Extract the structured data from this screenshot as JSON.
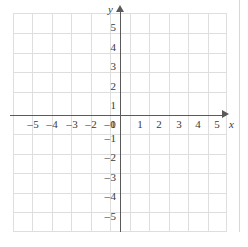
{
  "figure": {
    "kind": "cartesian-coordinate-plane",
    "axis_color": "#5a5a5a",
    "grid_color": "#dedede",
    "label_color": "#3a3a3a",
    "background": "#ffffff"
  },
  "axes": {
    "x": {
      "name": "x",
      "min": -5,
      "max": 5,
      "step": 1,
      "arrow": "right",
      "tick_labels": [
        "-5",
        "-4",
        "-3",
        "-2",
        "-1",
        "1",
        "2",
        "3",
        "4",
        "5"
      ],
      "tick_values": [
        -5,
        -4,
        -3,
        -2,
        -1,
        1,
        2,
        3,
        4,
        5
      ]
    },
    "y": {
      "name": "y",
      "min": -5,
      "max": 5,
      "step": 1,
      "arrow": "up",
      "tick_labels": [
        "5",
        "4",
        "3",
        "2",
        "1",
        "-1",
        "-2",
        "-3",
        "-4",
        "-5"
      ],
      "tick_values": [
        5,
        4,
        3,
        2,
        1,
        -1,
        -2,
        -3,
        -4,
        -5
      ]
    }
  },
  "origin": {
    "label": "0",
    "x": 0,
    "y": 0
  },
  "grid": {
    "visible": true,
    "x_lines": 11,
    "y_lines": 11,
    "spacing_px": 19.5
  },
  "ticks": {
    "x": [
      {
        "label": "-5",
        "sign": "–",
        "digit": "5",
        "negative": true
      },
      {
        "label": "-4",
        "sign": "–",
        "digit": "4",
        "negative": true
      },
      {
        "label": "-3",
        "sign": "–",
        "digit": "3",
        "negative": true
      },
      {
        "label": "-2",
        "sign": "–",
        "digit": "2",
        "negative": true
      },
      {
        "label": "-1",
        "sign": "–",
        "digit": "1",
        "negative": true
      },
      {
        "label": "1",
        "sign": "",
        "digit": "1",
        "negative": false
      },
      {
        "label": "2",
        "sign": "",
        "digit": "2",
        "negative": false
      },
      {
        "label": "3",
        "sign": "",
        "digit": "3",
        "negative": false
      },
      {
        "label": "4",
        "sign": "",
        "digit": "4",
        "negative": false
      },
      {
        "label": "5",
        "sign": "",
        "digit": "5",
        "negative": false
      }
    ],
    "y": [
      {
        "label": "5",
        "sign": "",
        "digit": "5",
        "negative": false
      },
      {
        "label": "4",
        "sign": "",
        "digit": "4",
        "negative": false
      },
      {
        "label": "3",
        "sign": "",
        "digit": "3",
        "negative": false
      },
      {
        "label": "2",
        "sign": "",
        "digit": "2",
        "negative": false
      },
      {
        "label": "1",
        "sign": "",
        "digit": "1",
        "negative": false
      },
      {
        "label": "-1",
        "sign": "–",
        "digit": "1",
        "negative": true
      },
      {
        "label": "-2",
        "sign": "–",
        "digit": "2",
        "negative": true
      },
      {
        "label": "-3",
        "sign": "–",
        "digit": "3",
        "negative": true
      },
      {
        "label": "-4",
        "sign": "–",
        "digit": "4",
        "negative": true
      },
      {
        "label": "-5",
        "sign": "–",
        "digit": "5",
        "negative": true
      }
    ]
  },
  "data_points": [],
  "plotted_series": []
}
